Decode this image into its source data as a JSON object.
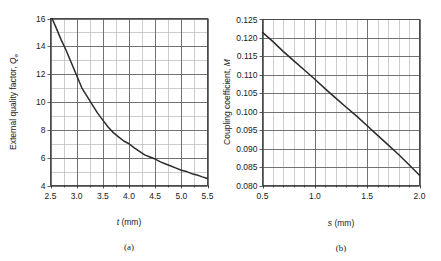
{
  "figure": {
    "panels": [
      {
        "id": "a",
        "caption": "(a)",
        "x_axis_title_symbol": "t",
        "x_axis_title_units": " (mm)",
        "y_axis_title_text": "External quality factor, ",
        "y_axis_title_symbol": "Q",
        "y_axis_title_subscript": "e",
        "x_ticks": [
          "2.5",
          "3.0",
          "3.5",
          "4.0",
          "4.5",
          "5.0",
          "5.5"
        ],
        "y_ticks": [
          "4",
          "6",
          "8",
          "10",
          "12",
          "14",
          "16"
        ]
      },
      {
        "id": "b",
        "caption": "(b)",
        "x_axis_title_symbol": "s",
        "x_axis_title_units": " (mm)",
        "y_axis_title_text": "Coupling coefficient, ",
        "y_axis_title_symbol": "M",
        "y_axis_title_subscript": "",
        "x_ticks": [
          "0.5",
          "1.0",
          "1.5",
          "2.0"
        ],
        "y_ticks": [
          "0.080",
          "0.085",
          "0.090",
          "0.095",
          "0.100",
          "0.105",
          "0.110",
          "0.115",
          "0.120",
          "0.125"
        ]
      }
    ]
  },
  "colors": {
    "curve": "#2b2b2b",
    "grid_major": "#5a5a5a",
    "grid_minor": "#b8b8b8",
    "frame": "#6a6a6a",
    "text": "#1a1a1a",
    "background": "#ffffff"
  },
  "chart_data": [
    {
      "type": "line",
      "panel": "a",
      "title": "",
      "xlabel": "t (mm)",
      "ylabel": "External quality factor, Qe",
      "xlim": [
        2.5,
        5.5
      ],
      "ylim": [
        4,
        16
      ],
      "grid": true,
      "legend": "none",
      "x_major_step": 0.5,
      "x_minor_step": 0.25,
      "y_major_step": 2,
      "y_minor_step": 1,
      "x_tick_labels": [
        "2.5",
        "3.0",
        "3.5",
        "4.0",
        "4.5",
        "5.0",
        "5.5"
      ],
      "y_tick_labels": [
        "4",
        "6",
        "8",
        "10",
        "12",
        "14",
        "16"
      ],
      "series": [
        {
          "name": "External quality factor",
          "x": [
            2.53,
            2.6,
            2.7,
            2.8,
            2.9,
            3.0,
            3.1,
            3.2,
            3.3,
            3.4,
            3.5,
            3.6,
            3.7,
            3.8,
            3.9,
            4.0,
            4.1,
            4.2,
            4.3,
            4.4,
            4.5,
            4.6,
            4.7,
            4.8,
            4.9,
            5.0,
            5.1,
            5.2,
            5.3,
            5.4,
            5.5
          ],
          "y": [
            16.0,
            15.4,
            14.5,
            13.7,
            12.8,
            11.9,
            11.0,
            10.4,
            9.8,
            9.2,
            8.7,
            8.2,
            7.8,
            7.5,
            7.2,
            7.0,
            6.7,
            6.45,
            6.2,
            6.05,
            5.9,
            5.7,
            5.55,
            5.4,
            5.25,
            5.1,
            5.0,
            4.85,
            4.75,
            4.62,
            4.5
          ]
        }
      ]
    },
    {
      "type": "line",
      "panel": "b",
      "title": "",
      "xlabel": "s (mm)",
      "ylabel": "Coupling coefficient, M",
      "xlim": [
        0.5,
        2.0
      ],
      "ylim": [
        0.08,
        0.125
      ],
      "grid": true,
      "legend": "none",
      "x_major_step": 0.5,
      "x_minor_step": 0.1,
      "y_major_step": 0.005,
      "y_minor_step": 0.005,
      "x_tick_labels": [
        "0.5",
        "1.0",
        "1.5",
        "2.0"
      ],
      "y_tick_labels": [
        "0.080",
        "0.085",
        "0.090",
        "0.095",
        "0.100",
        "0.105",
        "0.110",
        "0.115",
        "0.120",
        "0.125"
      ],
      "series": [
        {
          "name": "Coupling coefficient",
          "x": [
            0.5,
            0.6,
            0.7,
            0.8,
            0.9,
            1.0,
            1.1,
            1.2,
            1.3,
            1.4,
            1.5,
            1.6,
            1.7,
            1.8,
            1.9,
            2.0
          ],
          "y": [
            0.1215,
            0.119,
            0.1163,
            0.1138,
            0.1113,
            0.1088,
            0.1062,
            0.1037,
            0.1012,
            0.0988,
            0.0962,
            0.0936,
            0.091,
            0.0884,
            0.0856,
            0.0828
          ]
        }
      ]
    }
  ]
}
